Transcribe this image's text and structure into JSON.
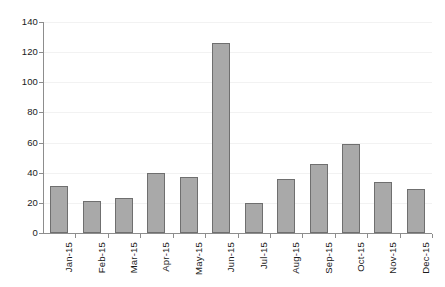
{
  "chart_data": {
    "type": "bar",
    "title": "",
    "subtitle": "",
    "xlabel": "",
    "ylabel": "",
    "categories": [
      "Jan-15",
      "Feb-15",
      "Mar-15",
      "Apr-15",
      "May-15",
      "Jun-15",
      "Jul-15",
      "Aug-15",
      "Sep-15",
      "Oct-15",
      "Nov-15",
      "Dec-15"
    ],
    "values": [
      31,
      21,
      23,
      40,
      37,
      126,
      20,
      36,
      46,
      59,
      34,
      29
    ],
    "ylim": [
      0,
      140
    ],
    "yticks": [
      0,
      20,
      40,
      60,
      80,
      100,
      120,
      140
    ],
    "ytick_labels": [
      "0",
      "20",
      "40",
      "60",
      "80",
      "100",
      "120",
      "140"
    ],
    "grid": true,
    "grid_axis": "y",
    "legend": false,
    "legend_position": "none",
    "series": [
      {
        "name": "",
        "values": [
          31,
          21,
          23,
          40,
          37,
          126,
          20,
          36,
          46,
          59,
          34,
          29
        ]
      }
    ],
    "annotations": []
  },
  "style": {
    "bar_fill": "#a9a9a9",
    "bar_border": "#6f6f6f",
    "axis_color": "#8d8d8d",
    "grid_color": "#f2f2f2",
    "text_color": "#1a1a1a",
    "background": "#ffffff"
  }
}
